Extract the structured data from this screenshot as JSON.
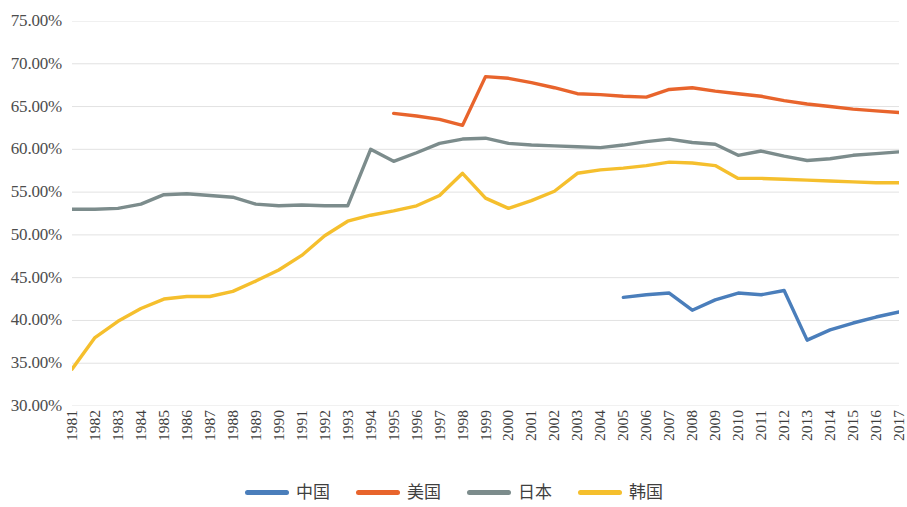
{
  "chart_data": {
    "type": "line",
    "title": "",
    "xlabel": "",
    "ylabel": "",
    "grid": true,
    "legend_position": "bottom",
    "ylim": [
      30,
      75
    ],
    "ytick_labels": [
      "75.00%",
      "70.00%",
      "65.00%",
      "60.00%",
      "55.00%",
      "50.00%",
      "45.00%",
      "40.00%",
      "35.00%",
      "30.00%"
    ],
    "ytick_values": [
      75,
      70,
      65,
      60,
      55,
      50,
      45,
      40,
      35,
      30
    ],
    "categories": [
      "1981",
      "1982",
      "1983",
      "1984",
      "1985",
      "1986",
      "1987",
      "1988",
      "1989",
      "1990",
      "1991",
      "1992",
      "1993",
      "1994",
      "1995",
      "1996",
      "1997",
      "1998",
      "1999",
      "2000",
      "2001",
      "2002",
      "2003",
      "2004",
      "2005",
      "2006",
      "2007",
      "2008",
      "2009",
      "2010",
      "2011",
      "2012",
      "2013",
      "2014",
      "2015",
      "2016",
      "2017"
    ],
    "series": [
      {
        "name": "中国",
        "color": "#4A7EBB",
        "values": [
          null,
          null,
          null,
          null,
          null,
          null,
          null,
          null,
          null,
          null,
          null,
          null,
          null,
          null,
          null,
          null,
          null,
          null,
          null,
          null,
          null,
          null,
          null,
          null,
          42.7,
          43.0,
          43.2,
          41.2,
          42.4,
          43.2,
          43.0,
          43.5,
          37.7,
          38.9,
          39.7,
          40.4,
          41.0
        ]
      },
      {
        "name": "美国",
        "color": "#E8642C",
        "values": [
          null,
          null,
          null,
          null,
          null,
          null,
          null,
          null,
          null,
          null,
          null,
          null,
          null,
          null,
          64.2,
          63.9,
          63.5,
          62.8,
          68.5,
          68.3,
          67.8,
          67.2,
          66.5,
          66.4,
          66.2,
          66.1,
          67.0,
          67.2,
          66.8,
          66.5,
          66.2,
          65.7,
          65.3,
          65.0,
          64.7,
          64.5,
          64.3
        ]
      },
      {
        "name": "日本",
        "color": "#7C8C8C",
        "values": [
          53.0,
          53.0,
          53.1,
          53.6,
          54.7,
          54.8,
          54.6,
          54.4,
          53.6,
          53.4,
          53.5,
          53.4,
          53.4,
          60.0,
          58.6,
          59.6,
          60.7,
          61.2,
          61.3,
          60.7,
          60.5,
          60.4,
          60.3,
          60.2,
          60.5,
          60.9,
          61.2,
          60.8,
          60.6,
          59.3,
          59.8,
          59.2,
          58.7,
          58.9,
          59.3,
          59.5,
          59.7
        ]
      },
      {
        "name": "韩国",
        "color": "#F5BF2D",
        "values": [
          34.3,
          38.0,
          39.9,
          41.4,
          42.5,
          42.8,
          42.8,
          43.4,
          44.6,
          45.9,
          47.6,
          49.9,
          51.6,
          52.3,
          52.8,
          53.4,
          54.6,
          57.2,
          54.3,
          53.1,
          54.0,
          55.1,
          57.2,
          57.6,
          57.8,
          58.1,
          58.5,
          58.4,
          58.1,
          56.6,
          56.6,
          56.5,
          56.4,
          56.3,
          56.2,
          56.1,
          56.1
        ]
      }
    ]
  },
  "legend": {
    "items": [
      {
        "label": "中国",
        "color": "#4A7EBB"
      },
      {
        "label": "美国",
        "color": "#E8642C"
      },
      {
        "label": "日本",
        "color": "#7C8C8C"
      },
      {
        "label": "韩国",
        "color": "#F5BF2D"
      }
    ]
  }
}
